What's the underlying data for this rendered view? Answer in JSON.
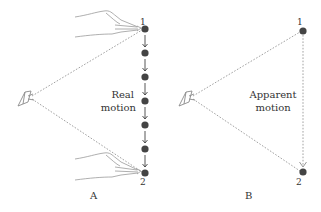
{
  "figure": {
    "panels": [
      {
        "id": "A",
        "label": "A",
        "caption": [
          "Real",
          "motion"
        ],
        "point_labels": [
          "1",
          "2"
        ],
        "intermediate_dot_count": 5,
        "has_hands": true,
        "motion_type": "real"
      },
      {
        "id": "B",
        "label": "B",
        "caption": [
          "Apparent",
          "motion"
        ],
        "point_labels": [
          "1",
          "2"
        ],
        "intermediate_dot_count": 0,
        "has_hands": false,
        "motion_type": "apparent"
      }
    ],
    "colors": {
      "dot": "#444444",
      "dashed_line": "#8a8a8a",
      "text": "#333333"
    }
  }
}
